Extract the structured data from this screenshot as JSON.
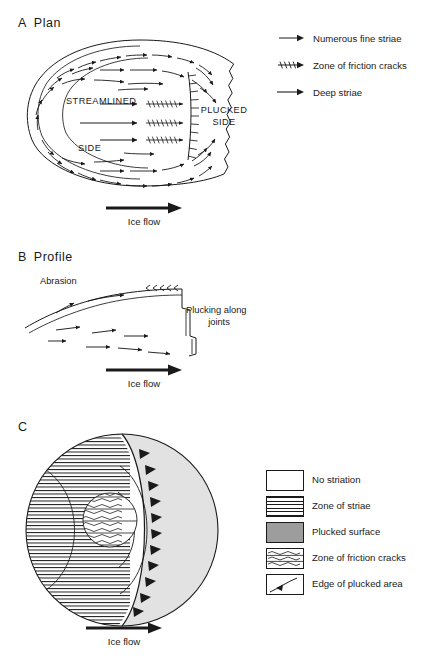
{
  "figure": {
    "panels": [
      {
        "letter": "A",
        "title": "Plan"
      },
      {
        "letter": "B",
        "title": "Profile"
      },
      {
        "letter": "C",
        "title": ""
      }
    ]
  },
  "panel_a": {
    "letter": "A",
    "title": "Plan",
    "inner_labels": {
      "streamlined": "STREAMLINED",
      "side": "SIDE",
      "plucked_line1": "PLUCKED",
      "plucked_line2": "SIDE"
    },
    "flow_label": "Ice flow",
    "legend": [
      {
        "symbol": "short-arrow-icon",
        "label": "Numerous fine striae"
      },
      {
        "symbol": "friction-crack-arrow-icon",
        "label": "Zone of friction cracks"
      },
      {
        "symbol": "long-arrow-icon",
        "label": "Deep striae"
      }
    ]
  },
  "panel_b": {
    "letter": "B",
    "title": "Profile",
    "abrasion_label": "Abrasion",
    "plucking_label_line1": "Plucking along",
    "plucking_label_line2": "joints",
    "flow_label": "Ice flow"
  },
  "panel_c": {
    "letter": "C",
    "title": "",
    "flow_label": "Ice flow",
    "legend": [
      {
        "swatch": "no-striation-swatch",
        "label": "No striation"
      },
      {
        "swatch": "zone-of-striae-swatch",
        "label": "Zone of striae"
      },
      {
        "swatch": "plucked-surface-swatch",
        "label": "Plucked surface"
      },
      {
        "swatch": "zone-of-friction-cracks-swatch",
        "label": "Zone of friction cracks"
      },
      {
        "swatch": "edge-of-plucked-area-swatch",
        "label": "Edge of plucked area"
      }
    ]
  },
  "colors": {
    "ink": "#1a1a1a",
    "background": "#ffffff",
    "plucked_surface_gray": "#9d9d9d",
    "panel_c_plucked_fill": "#e2e2e2"
  }
}
